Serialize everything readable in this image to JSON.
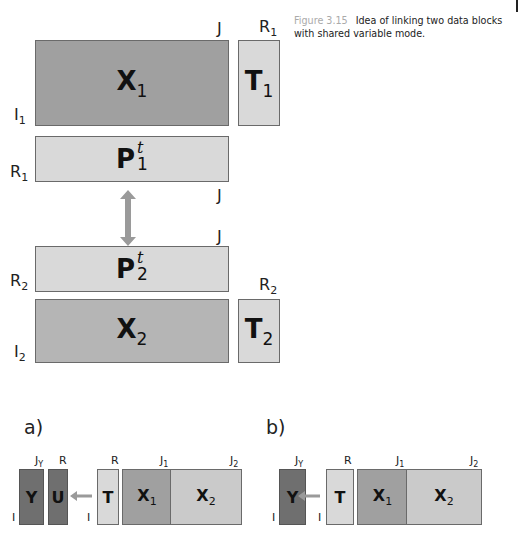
{
  "caption": {
    "figure_label": "Figure 3.15",
    "text": "Idea of linking two data blocks with shared variable mode."
  },
  "colors": {
    "dark_block": "#a0a0a0",
    "medium_block": "#b5b5b5",
    "light_block": "#d9d9d9",
    "darkest_block": "#6f6f6f",
    "arrow": "#9a9a9a",
    "border": "#6a6a6a"
  },
  "top": {
    "X1": {
      "name": "X",
      "sub": "1",
      "row_label": "I",
      "row_sub": "1",
      "col_label": "J"
    },
    "T1": {
      "name": "T",
      "sub": "1",
      "col_label": "R",
      "col_sub": "1"
    },
    "P1": {
      "name": "P",
      "sup": "t",
      "sub": "1",
      "row_label": "R",
      "row_sub": "1",
      "col_label": "J"
    },
    "P2": {
      "name": "P",
      "sup": "t",
      "sub": "2",
      "row_label": "R",
      "row_sub": "2",
      "col_label": "J"
    },
    "X2": {
      "name": "X",
      "sub": "2",
      "row_label": "I",
      "row_sub": "2"
    },
    "T2": {
      "name": "T",
      "sub": "2",
      "col_label": "R",
      "col_sub": "2"
    }
  },
  "panel_a": {
    "label": "a)",
    "Y": {
      "name": "Y",
      "col_label": "J",
      "col_sub": "Y",
      "row_label": "I"
    },
    "U": {
      "name": "U",
      "col_label": "R"
    },
    "T": {
      "name": "T",
      "col_label": "R",
      "row_label": "I"
    },
    "X1": {
      "name": "X",
      "sub": "1",
      "col_label": "J",
      "col_sub": "1"
    },
    "X2": {
      "name": "X",
      "sub": "2",
      "col_label": "J",
      "col_sub": "2"
    }
  },
  "panel_b": {
    "label": "b)",
    "Y": {
      "name": "Y",
      "col_label": "J",
      "col_sub": "Y",
      "row_label": "I"
    },
    "T": {
      "name": "T",
      "col_label": "R",
      "row_label": "I"
    },
    "X1": {
      "name": "X",
      "sub": "1",
      "col_label": "J",
      "col_sub": "1"
    },
    "X2": {
      "name": "X",
      "sub": "2",
      "col_label": "J",
      "col_sub": "2"
    }
  }
}
